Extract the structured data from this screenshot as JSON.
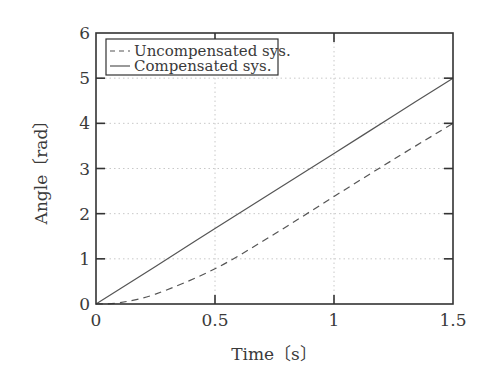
{
  "chart_data": {
    "type": "line",
    "title": "",
    "xlabel": "Time〔s〕",
    "ylabel": "Angle〔rad〕",
    "xlim": [
      0,
      1.5
    ],
    "ylim": [
      0,
      6
    ],
    "xticks": [
      "0",
      "0.5",
      "1",
      "1.5"
    ],
    "yticks": [
      "0",
      "1",
      "2",
      "3",
      "4",
      "5",
      "6"
    ],
    "grid": true,
    "legend_position": "upper left",
    "x": [
      0,
      0.1,
      0.25,
      0.5,
      0.75,
      1.0,
      1.25,
      1.5
    ],
    "series": [
      {
        "name": "Uncompensated sys.",
        "style": "dashed",
        "values": [
          0,
          0.03,
          0.22,
          0.78,
          1.55,
          2.38,
          3.2,
          4.0
        ]
      },
      {
        "name": "Compensated sys.",
        "style": "solid",
        "values": [
          0,
          0.33,
          0.83,
          1.67,
          2.5,
          3.33,
          4.17,
          5.0
        ]
      }
    ]
  },
  "colors": {
    "axis": "#333333",
    "grid": "#c8c8c8",
    "line": "#555555"
  }
}
